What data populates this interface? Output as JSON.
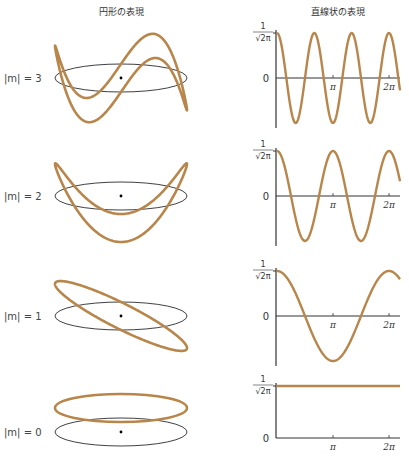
{
  "headers": {
    "left": "円形の表現",
    "right": "直線状の表現"
  },
  "colors": {
    "wave": "#b8864a",
    "axis": "#333333",
    "ellipse": "#2a2a2a"
  },
  "axis_labels": {
    "top_numerator": "1",
    "top_denominator": "√2π",
    "zero": "0",
    "pi": "π",
    "two_pi": "2π"
  },
  "rows": [
    {
      "label": "|m| = 3",
      "m": 3,
      "cy": 78
    },
    {
      "label": "|m| = 2",
      "m": 2,
      "cy": 196
    },
    {
      "label": "|m| = 1",
      "m": 1,
      "cy": 316
    },
    {
      "label": "|m| = 0",
      "m": 0,
      "cy": 432
    }
  ],
  "chart_data": [
    {
      "type": "line",
      "title": "|m| = 3",
      "function": "cos(3φ)/√(2π)",
      "x": [
        "0",
        "π",
        "2π"
      ],
      "ylim": [
        "-1/√2π",
        "1/√2π"
      ]
    },
    {
      "type": "line",
      "title": "|m| = 2",
      "function": "cos(2φ)/√(2π)",
      "x": [
        "0",
        "π",
        "2π"
      ],
      "ylim": [
        "-1/√2π",
        "1/√2π"
      ]
    },
    {
      "type": "line",
      "title": "|m| = 1",
      "function": "cos(φ)/√(2π)",
      "x": [
        "0",
        "π",
        "2π"
      ],
      "ylim": [
        "-1/√2π",
        "1/√2π"
      ]
    },
    {
      "type": "line",
      "title": "|m| = 0",
      "function": "1/√(2π)",
      "x": [
        "0",
        "π",
        "2π"
      ],
      "ylim": [
        "0",
        "1/√2π"
      ]
    }
  ]
}
